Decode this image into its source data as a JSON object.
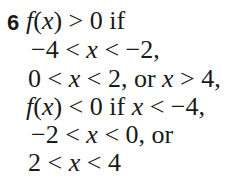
{
  "answer": {
    "number": "6",
    "lines": [
      "f(x) > 0 if",
      "−4 < x < −2,",
      "0 < x < 2, or x > 4,",
      "f(x) < 0 if x < −4,",
      "−2 < x < 0, or",
      "2 < x < 4"
    ]
  }
}
